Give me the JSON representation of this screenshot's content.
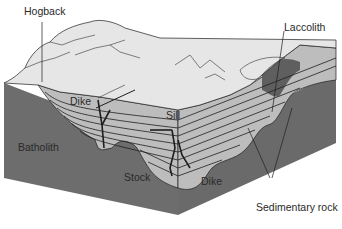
{
  "diagram": {
    "type": "geologic block diagram",
    "colors": {
      "igneous_dark": "#6d6d6d",
      "sediment_light": "#bdbdbd",
      "surface": "#e6e6e6",
      "line": "#1e1e1e",
      "background": "#ffffff"
    },
    "labels": {
      "hogback": "Hogback",
      "laccolith": "Laccolith",
      "dike_left": "Dike",
      "sill": "Sill",
      "batholith": "Batholith",
      "stock": "Stock",
      "dike_right": "Dike",
      "sedimentary_rock": "Sedimentary rock"
    }
  }
}
